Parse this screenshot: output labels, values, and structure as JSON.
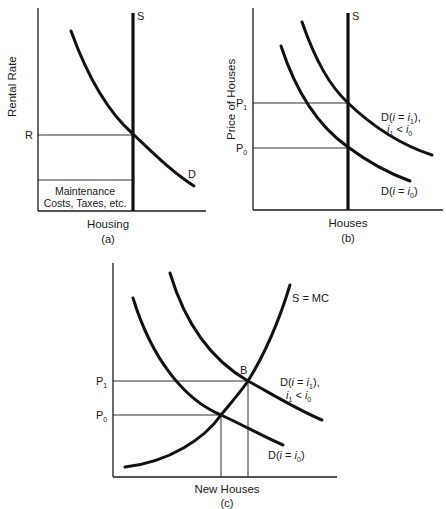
{
  "figure": {
    "panels": [
      {
        "id": "a",
        "caption": "(a)",
        "y_axis_label": "Rental Rate",
        "x_axis_label": "Housing",
        "price_labels": [
          "R"
        ],
        "curve_labels": {
          "supply": "S",
          "demand": "D"
        },
        "box_label_line1": "Maintenance",
        "box_label_line2": "Costs, Taxes, etc."
      },
      {
        "id": "b",
        "caption": "(b)",
        "y_axis_label": "Price of Houses",
        "x_axis_label": "Houses",
        "price_labels": {
          "p1_main": "P",
          "p1_sub": "1",
          "p0_main": "P",
          "p0_sub": "0"
        },
        "curve_labels": {
          "supply": "S",
          "d1_line1_prefix": "D(",
          "d1_i": "i",
          "d1_eq": " = ",
          "d1_i2": "i",
          "d1_sub": "1",
          "d1_suffix": "),",
          "d1_line2_i": "i",
          "d1_line2_sub1": "1",
          "d1_line2_lt": " < ",
          "d1_line2_i2": "i",
          "d1_line2_sub0": "0",
          "d0_prefix": "D(",
          "d0_i": "i",
          "d0_eq": " = ",
          "d0_i2": "i",
          "d0_sub": "0",
          "d0_suffix": ")"
        }
      },
      {
        "id": "c",
        "caption": "(c)",
        "x_axis_label": "New Houses",
        "price_labels": {
          "p1_main": "P",
          "p1_sub": "1",
          "p0_main": "P",
          "p0_sub": "0"
        },
        "point_label": "B",
        "curve_labels": {
          "supply": "S = MC",
          "d1_line1_prefix": "D(",
          "d1_i": "i",
          "d1_eq": " = ",
          "d1_i2": "i",
          "d1_sub": "1",
          "d1_suffix": "),",
          "d1_line2_i": "i",
          "d1_line2_sub1": "1",
          "d1_line2_lt": " < ",
          "d1_line2_i2": "i",
          "d1_line2_sub0": "0",
          "d0_prefix": "D(",
          "d0_i": "i",
          "d0_eq": " = ",
          "d0_i2": "i",
          "d0_sub": "0",
          "d0_suffix": ")"
        }
      }
    ],
    "colors": {
      "ink": "#111111",
      "background": "#ffffff"
    }
  }
}
